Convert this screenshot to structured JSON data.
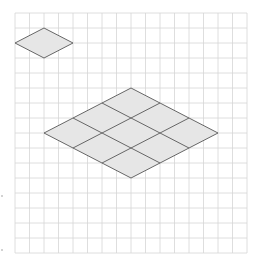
{
  "diagram": {
    "type": "isometric-grid-puzzle",
    "grid": {
      "x0": 15,
      "y0": 13,
      "cell_w": 14.5,
      "cell_h": 15,
      "cols": 16,
      "rows": 16,
      "line_color": "#d6d6d6"
    },
    "shape_style": {
      "fill": "#e6e6e6",
      "stroke": "#666666"
    },
    "small_rhombus": {
      "points": [
        [
          15,
          43
        ],
        [
          44,
          28
        ],
        [
          73,
          43
        ],
        [
          44,
          58
        ]
      ]
    },
    "large_rhombus": {
      "divisions": 3,
      "top": [
        131,
        88
      ],
      "left": [
        44,
        133
      ],
      "right": [
        218,
        133
      ],
      "bottom": [
        131,
        178
      ]
    },
    "margin_dots": [
      [
        2,
        196
      ],
      [
        2,
        250
      ]
    ]
  }
}
